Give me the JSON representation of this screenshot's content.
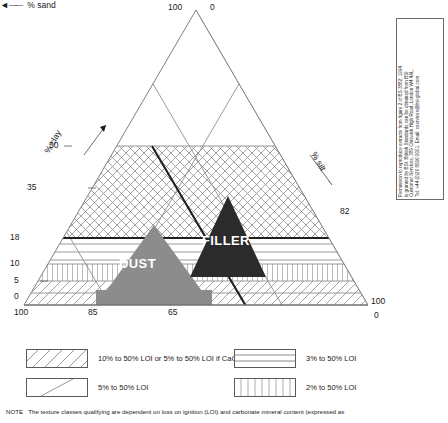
{
  "chart_data": {
    "type": "ternary",
    "axes": {
      "left": {
        "label": "% clay",
        "ticks": [
          "100",
          "50",
          "35",
          "18",
          "10",
          "5",
          "0"
        ]
      },
      "right": {
        "label": "% silt",
        "ticks": [
          "0",
          "82",
          "100"
        ]
      },
      "bottom": {
        "label": "% sand",
        "ticks": [
          "100",
          "85",
          "65",
          "0"
        ],
        "direction_arrow": "left"
      }
    },
    "regions": [
      {
        "name": "DUST",
        "fill": "#8c8c8c",
        "text_color": "#ffffff"
      },
      {
        "name": "FILLER",
        "fill": "#2b2b2b",
        "text_color": "#ffffff"
      }
    ],
    "apex_labels": {
      "top_left": "100",
      "top_right": "0",
      "bottom_left": "100",
      "bottom_right_axis": "100",
      "bottom_right_lower": "0"
    }
  },
  "diagram": {
    "apex_left_value": "100",
    "apex_right_value": "0",
    "left_axis_ticks": [
      "100",
      "50",
      "35",
      "18",
      "10",
      "5",
      "0"
    ],
    "right_axis_ticks": [
      "82",
      "100"
    ],
    "bottom_axis_ticks": [
      "100",
      "85",
      "65",
      "0"
    ],
    "clay_axis_label": "% clay",
    "silt_axis_label": "% silt",
    "sand_axis_label": "% sand",
    "sand_arrow": "◄",
    "sand_arrow_line": "——",
    "region_dust": "DUST",
    "region_filler": "FILLER"
  },
  "copyright": {
    "lines": [
      "Permission to reproduce extracts from figure 2 of BS 3882: 1994",
      "is granted by BSI. British Standards can be obtained from BSI",
      "Customer Services, 389 Chiswick High Road, London W4 4AL.",
      "Tel: +44 (0)20 8996 9001. Email: cservices@bsi-global.com"
    ]
  },
  "legend": {
    "items": [
      {
        "pattern": "diagonal-hatch-dense",
        "label_html": "10% to 50% LOI  or  5% to 50% LOI if CaCO<sub>3</sub> > 5%",
        "label": "10% to 50% LOI  or  5% to 50% LOI if CaCO3 > 5%"
      },
      {
        "pattern": "diagonal-single",
        "label_html": "5% to 50% LOI",
        "label": "5% to 50% LOI"
      },
      {
        "pattern": "horizontal-lines",
        "label_html": "3% to 50% LOI",
        "label": "3% to 50% LOI"
      },
      {
        "pattern": "vertical-lines",
        "label_html": "2% to 50% LOI",
        "label": "2% to 50% LOI"
      }
    ]
  },
  "note": {
    "prefix": "NOTE",
    "text": "The texture classes qualifying are dependent on loss on ignition (LOI) and carbonate mineral content (expressed as"
  }
}
